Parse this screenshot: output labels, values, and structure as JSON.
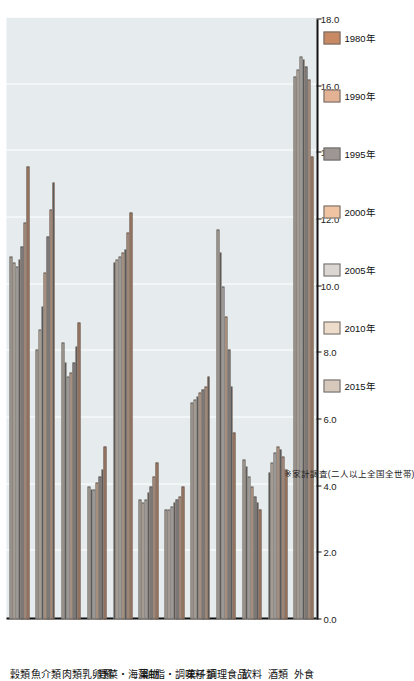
{
  "chart_data": {
    "type": "bar",
    "orientation": "horizontal",
    "title": "",
    "xlabel": "",
    "ylabel": "",
    "xlim": [
      0.0,
      18.0
    ],
    "grid": true,
    "legend_position": "bottom",
    "axis_ticks": [
      "0.0",
      "2.0",
      "4.0",
      "6.0",
      "8.0",
      "10.0",
      "12.0",
      "14.0",
      "16.0",
      "18.0"
    ],
    "axis_tick_values": [
      0.0,
      2.0,
      4.0,
      6.0,
      8.0,
      10.0,
      12.0,
      14.0,
      16.0,
      18.0
    ],
    "categories": [
      "穀類",
      "魚介類",
      "肉類",
      "乳卵類",
      "野菜・海藻",
      "果物",
      "油脂・調味料",
      "菓子類",
      "調理食品",
      "飲料",
      "酒類",
      "外食"
    ],
    "series": [
      {
        "name": "1980年",
        "color": "#c98a63",
        "values": [
          13.6,
          13.1,
          8.9,
          5.2,
          12.2,
          4.7,
          4.0,
          7.3,
          5.6,
          3.3,
          4.5,
          13.9
        ]
      },
      {
        "name": "1990年",
        "color": "#e3b294",
        "values": [
          11.9,
          12.3,
          8.2,
          4.5,
          11.6,
          4.3,
          3.7,
          7.0,
          7.0,
          3.5,
          4.9,
          16.2
        ]
      },
      {
        "name": "1995年",
        "color": "#9e9693",
        "values": [
          11.2,
          11.5,
          7.7,
          4.3,
          11.1,
          4.0,
          3.6,
          6.9,
          8.1,
          3.7,
          5.1,
          16.6
        ]
      },
      {
        "name": "2000年",
        "color": "#f0c3a3",
        "values": [
          10.8,
          10.4,
          7.4,
          4.1,
          11.0,
          3.8,
          3.5,
          6.8,
          9.1,
          4.0,
          5.2,
          16.8
        ]
      },
      {
        "name": "2005年",
        "color": "#dcd6d2",
        "values": [
          10.6,
          9.4,
          7.3,
          3.9,
          10.9,
          3.6,
          3.4,
          6.7,
          10.0,
          4.3,
          5.0,
          16.9
        ]
      },
      {
        "name": "2010年",
        "color": "#eddcc9",
        "values": [
          10.7,
          8.7,
          7.7,
          3.9,
          10.8,
          3.5,
          3.3,
          6.6,
          11.0,
          4.6,
          4.7,
          16.5
        ]
      },
      {
        "name": "2015年",
        "color": "#d6c8ba",
        "values": [
          10.9,
          8.1,
          8.3,
          4.0,
          10.7,
          3.6,
          3.3,
          6.5,
          11.7,
          4.8,
          4.4,
          16.3
        ]
      }
    ],
    "note": "※家計調査(二人以上全国全世帯)"
  },
  "legend": {
    "items": [
      {
        "label": "1980年"
      },
      {
        "label": "1990年"
      },
      {
        "label": "1995年"
      },
      {
        "label": "2000年"
      },
      {
        "label": "2005年"
      },
      {
        "label": "2010年"
      },
      {
        "label": "2015年"
      }
    ]
  },
  "footnote": {
    "text": "※家計調査(二人以上全国全世帯)"
  },
  "colors": {
    "plot_background": "#e6ecee",
    "gridline": "#ffffff",
    "axis": "#111111",
    "page_background": "#ffffff"
  }
}
